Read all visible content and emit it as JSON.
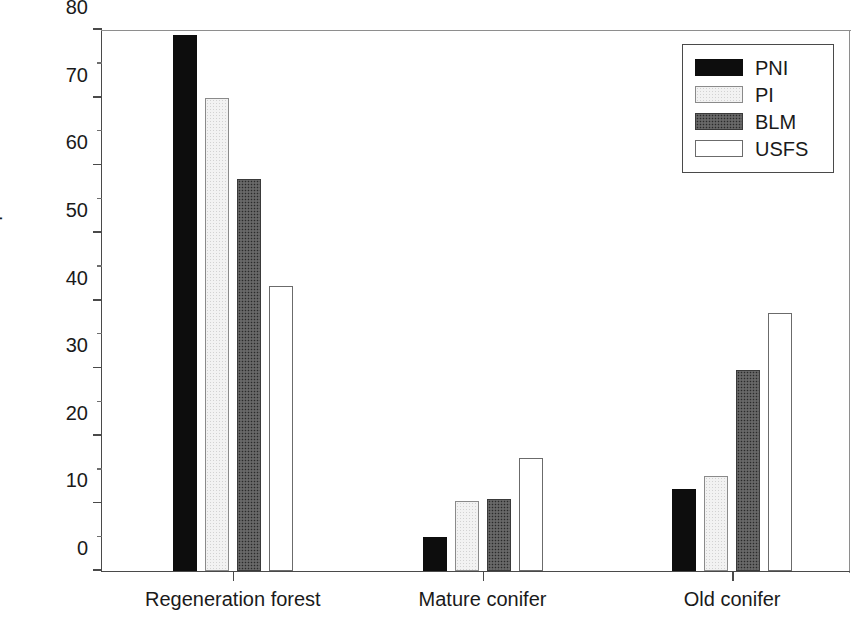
{
  "chart_data": {
    "type": "bar",
    "title": "",
    "xlabel": "",
    "ylabel": "Percent ownership",
    "ylim": [
      0,
      80
    ],
    "ytick_step": 10,
    "yticks": [
      0,
      10,
      20,
      30,
      40,
      50,
      60,
      70,
      80
    ],
    "ytick_labels": [
      "0",
      "10",
      "20",
      "30",
      "40",
      "50",
      "60",
      "70",
      "80"
    ],
    "yminor_ticks": [
      5,
      15,
      25,
      35,
      45,
      55,
      65,
      75
    ],
    "grid": false,
    "legend_position": "upper right",
    "categories": [
      "Regeneration forest",
      "Mature conifer",
      "Old conifer"
    ],
    "series": [
      {
        "name": "PNI",
        "fill": "black",
        "color": "#0d0d0d",
        "values": [
          79.2,
          5.0,
          12.1
        ]
      },
      {
        "name": "PI",
        "fill": "light-gray",
        "color": "#f2f2f2",
        "values": [
          70.0,
          10.3,
          14.1
        ]
      },
      {
        "name": "BLM",
        "fill": "dark-stipple",
        "color": "#5b5b5b",
        "values": [
          57.9,
          10.7,
          29.7
        ]
      },
      {
        "name": "USFS",
        "fill": "white",
        "color": "#ffffff",
        "values": [
          42.2,
          16.7,
          38.1
        ]
      }
    ]
  },
  "legend": {
    "entries": [
      {
        "label": "PNI"
      },
      {
        "label": "PI"
      },
      {
        "label": "BLM"
      },
      {
        "label": "USFS"
      }
    ]
  }
}
